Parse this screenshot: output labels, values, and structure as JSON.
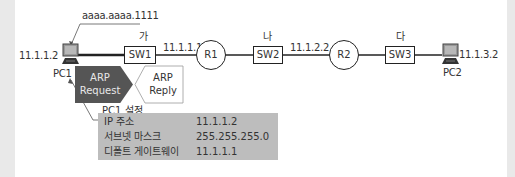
{
  "diagram": {
    "mac_label": "aaaa.aaaa.1111",
    "pc1": {
      "name": "PC1",
      "ip": "11.1.1.2"
    },
    "pc2": {
      "name": "PC2",
      "ip": "11.1.3.2"
    },
    "switches": [
      {
        "name": "SW1",
        "segment": "가"
      },
      {
        "name": "SW2",
        "segment": "나"
      },
      {
        "name": "SW3",
        "segment": "다"
      }
    ],
    "routers": [
      {
        "name": "R1",
        "interface_ip": "11.1.1.1"
      },
      {
        "name": "R2",
        "interface_ip": "11.1.2.2"
      }
    ],
    "arp_request": {
      "line1": "ARP",
      "line2": "Request",
      "color": "#555555"
    },
    "arp_reply": {
      "line1": "ARP",
      "line2": "Reply"
    },
    "pc1_settings": {
      "title": "PC1 설정",
      "rows": [
        {
          "key": "IP 주소",
          "value": "11.1.1.2"
        },
        {
          "key": "서브넷 마스크",
          "value": "255.255.255.0"
        },
        {
          "key": "디폴트 게이트웨이",
          "value": "11.1.1.1"
        }
      ]
    }
  }
}
